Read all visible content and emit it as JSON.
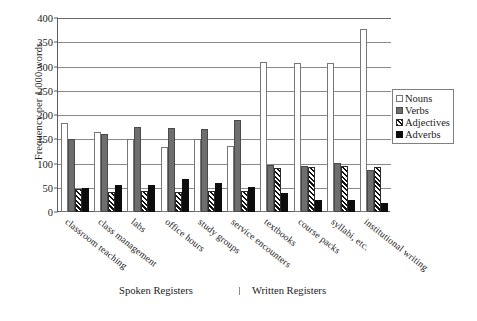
{
  "chart_data": {
    "type": "bar",
    "title": "",
    "xlabel": "",
    "ylabel": "Frequency per 1,000 words",
    "ylim": [
      0,
      400
    ],
    "yticks": [
      0,
      50,
      100,
      150,
      200,
      250,
      300,
      350,
      400
    ],
    "grid": true,
    "legend_position": "right",
    "categories": [
      "classroom teaching",
      "class management",
      "labs",
      "office hours",
      "study groups",
      "service encounters",
      "textbooks",
      "course packs",
      "syllabi, etc.",
      "institutional writing"
    ],
    "series": [
      {
        "name": "Nouns",
        "values": [
          184,
          165,
          150,
          134,
          150,
          136,
          310,
          308,
          308,
          377
        ]
      },
      {
        "name": "Verbs",
        "values": [
          151,
          160,
          176,
          173,
          172,
          189,
          96,
          95,
          102,
          87
        ]
      },
      {
        "name": "Adjectives",
        "values": [
          47,
          42,
          43,
          42,
          43,
          43,
          90,
          93,
          94,
          92
        ]
      },
      {
        "name": "Adverbs",
        "values": [
          50,
          55,
          55,
          68,
          60,
          52,
          40,
          24,
          24,
          18
        ]
      }
    ],
    "group_captions": {
      "spoken": "Spoken Registers",
      "written": "Written Registers"
    }
  },
  "legend": {
    "items": [
      {
        "label": "Nouns",
        "key": "nouns"
      },
      {
        "label": "Verbs",
        "key": "verbs"
      },
      {
        "label": "Adjectives",
        "key": "adjectives"
      },
      {
        "label": "Adverbs",
        "key": "adverbs"
      }
    ]
  },
  "colors": {
    "nouns": "#ffffff",
    "verbs": "#6e6e6e",
    "adjectives": "#111111",
    "adverbs": "#0d0d0d",
    "axis": "#5d5d5d",
    "grid": "#8a8a8a",
    "background": "#ffffff"
  }
}
